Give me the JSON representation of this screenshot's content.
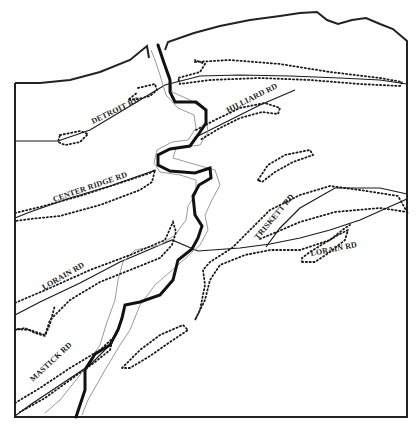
{
  "map": {
    "colors": {
      "boundary": "#222222",
      "river": "#111111",
      "floodplain": "#9a9a9a",
      "road": "#1a1a1a",
      "dotted": "#1a1a1a",
      "label": "#222222",
      "background": "#ffffff"
    },
    "labels": [
      {
        "text": "DETROIT RD",
        "x": 93,
        "y": 124,
        "angle": -26
      },
      {
        "text": "HILLIARD RD",
        "x": 228,
        "y": 113,
        "angle": -27
      },
      {
        "text": "CENTER RIDGE RD",
        "x": 54,
        "y": 202,
        "angle": -19
      },
      {
        "text": "TRISKETT RD",
        "x": 258,
        "y": 240,
        "angle": -50
      },
      {
        "text": "LORAIN RD",
        "x": 311,
        "y": 256,
        "angle": -11
      },
      {
        "text": "LORAIN RD",
        "x": 44,
        "y": 290,
        "angle": -30
      },
      {
        "text": "MASTICK RD",
        "x": 33,
        "y": 382,
        "angle": -43
      }
    ]
  }
}
